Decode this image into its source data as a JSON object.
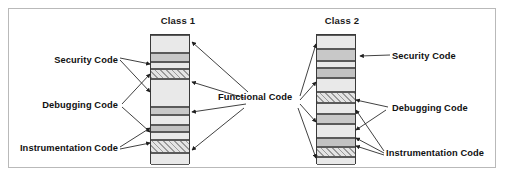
{
  "figure": {
    "type": "diagram",
    "background_color": "#ffffff",
    "frame_border_color": "#b9b9b9"
  },
  "columns": [
    {
      "id": "class-1",
      "title": "Class 1",
      "x": 150,
      "y": 34,
      "width": 40,
      "height": 130,
      "bands": [
        {
          "name": "functional",
          "top": 0,
          "height": 18,
          "fill": "#e9e9e9",
          "pattern": "solid"
        },
        {
          "name": "security",
          "top": 18,
          "height": 9,
          "fill": "#c8c8c8",
          "pattern": "solid"
        },
        {
          "name": "functional",
          "top": 27,
          "height": 7,
          "fill": "#e9e9e9",
          "pattern": "solid"
        },
        {
          "name": "debugging",
          "top": 34,
          "height": 10,
          "fill": "#dcdcdc",
          "pattern": "hatch"
        },
        {
          "name": "functional",
          "top": 44,
          "height": 28,
          "fill": "#e9e9e9",
          "pattern": "solid"
        },
        {
          "name": "security",
          "top": 72,
          "height": 8,
          "fill": "#c8c8c8",
          "pattern": "solid"
        },
        {
          "name": "functional",
          "top": 80,
          "height": 10,
          "fill": "#e9e9e9",
          "pattern": "solid"
        },
        {
          "name": "instrumentation",
          "top": 90,
          "height": 7,
          "fill": "#c2c2c2",
          "pattern": "solid"
        },
        {
          "name": "functional",
          "top": 97,
          "height": 8,
          "fill": "#e9e9e9",
          "pattern": "solid"
        },
        {
          "name": "debugging",
          "top": 105,
          "height": 13,
          "fill": "#dcdcdc",
          "pattern": "hatch"
        },
        {
          "name": "functional",
          "top": 118,
          "height": 12,
          "fill": "#e9e9e9",
          "pattern": "solid"
        }
      ]
    },
    {
      "id": "class-2",
      "title": "Class 2",
      "x": 316,
      "y": 34,
      "width": 40,
      "height": 130,
      "bands": [
        {
          "name": "functional",
          "top": 0,
          "height": 14,
          "fill": "#e9e9e9",
          "pattern": "solid"
        },
        {
          "name": "security",
          "top": 14,
          "height": 12,
          "fill": "#c8c8c8",
          "pattern": "solid"
        },
        {
          "name": "functional",
          "top": 26,
          "height": 7,
          "fill": "#e9e9e9",
          "pattern": "solid"
        },
        {
          "name": "instrumentation",
          "top": 33,
          "height": 10,
          "fill": "#c2c2c2",
          "pattern": "solid"
        },
        {
          "name": "functional",
          "top": 43,
          "height": 14,
          "fill": "#e9e9e9",
          "pattern": "solid"
        },
        {
          "name": "debugging",
          "top": 57,
          "height": 11,
          "fill": "#dcdcdc",
          "pattern": "hatch"
        },
        {
          "name": "functional",
          "top": 68,
          "height": 11,
          "fill": "#e9e9e9",
          "pattern": "solid"
        },
        {
          "name": "security",
          "top": 79,
          "height": 10,
          "fill": "#c8c8c8",
          "pattern": "solid"
        },
        {
          "name": "functional",
          "top": 89,
          "height": 14,
          "fill": "#e9e9e9",
          "pattern": "solid"
        },
        {
          "name": "instrumentation",
          "top": 103,
          "height": 9,
          "fill": "#c2c2c2",
          "pattern": "solid"
        },
        {
          "name": "debugging",
          "top": 112,
          "height": 10,
          "fill": "#dcdcdc",
          "pattern": "hatch"
        },
        {
          "name": "functional",
          "top": 122,
          "height": 8,
          "fill": "#e9e9e9",
          "pattern": "solid"
        }
      ]
    }
  ],
  "labels": {
    "left": {
      "security": "Security Code",
      "debugging": "Debugging Code",
      "instrumentation": "Instrumentation Code"
    },
    "center": {
      "functional": "Functional Code"
    },
    "right": {
      "security": "Security Code",
      "debugging": "Debugging Code",
      "instrumentation": "Instrumentation Code"
    }
  },
  "style": {
    "leader_line_color": "#2b2b2b",
    "band_border_color": "#5a5a5a",
    "bar_border_color": "#3a3a3a",
    "text_color": "#111111"
  }
}
